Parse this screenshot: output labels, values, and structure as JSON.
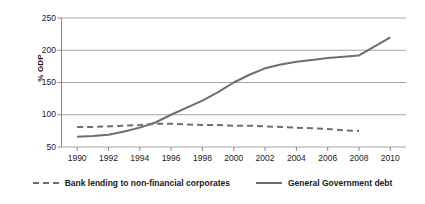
{
  "chart_data": {
    "type": "line",
    "title": "",
    "xlabel": "",
    "ylabel": "% GDP",
    "xlim": [
      1989,
      2011
    ],
    "ylim": [
      50,
      250
    ],
    "grid": true,
    "legend_position": "bottom",
    "x_ticks": [
      "1990",
      "1992",
      "1994",
      "1996",
      "1998",
      "2000",
      "2002",
      "2004",
      "2006",
      "2008",
      "2010"
    ],
    "y_ticks": [
      "50",
      "100",
      "150",
      "200",
      "250"
    ],
    "series": [
      {
        "name": "Bank lending to non-financial corporates",
        "style": "dashed",
        "color": "#6e6e6e",
        "x": [
          1990,
          1991,
          1992,
          1993,
          1994,
          1995,
          1996,
          1997,
          1998,
          1999,
          2000,
          2001,
          2002,
          2003,
          2004,
          2005,
          2006,
          2007,
          2008
        ],
        "values": [
          81,
          81,
          82,
          83,
          84,
          86,
          86,
          85,
          84,
          84,
          83,
          83,
          82,
          81,
          80,
          79,
          78,
          76,
          75
        ]
      },
      {
        "name": "General Government debt",
        "style": "solid",
        "color": "#6e6e6e",
        "x": [
          1990,
          1991,
          1992,
          1993,
          1994,
          1995,
          1996,
          1997,
          1998,
          1999,
          2000,
          2001,
          2002,
          2003,
          2004,
          2005,
          2006,
          2007,
          2008,
          2009,
          2010
        ],
        "values": [
          66,
          67,
          69,
          74,
          80,
          88,
          100,
          111,
          122,
          135,
          150,
          162,
          172,
          178,
          182,
          185,
          188,
          190,
          192,
          206,
          220
        ]
      }
    ]
  },
  "legend": {
    "items": [
      {
        "label": "Bank lending to non-financial corporates",
        "style": "dashed"
      },
      {
        "label": "General Government debt",
        "style": "solid"
      }
    ]
  }
}
